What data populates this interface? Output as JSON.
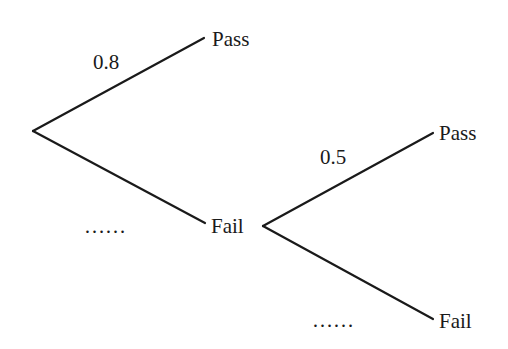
{
  "diagram": {
    "type": "probability-tree",
    "stroke_color": "#1a1a1a",
    "nodes": {
      "first_pass": "Pass",
      "first_fail": "Fail",
      "second_pass": "Pass",
      "second_fail": "Fail"
    },
    "edges": {
      "root_to_pass": "0.8",
      "root_to_fail": "……",
      "fail_to_pass": "0.5",
      "fail_to_fail": "……"
    }
  }
}
